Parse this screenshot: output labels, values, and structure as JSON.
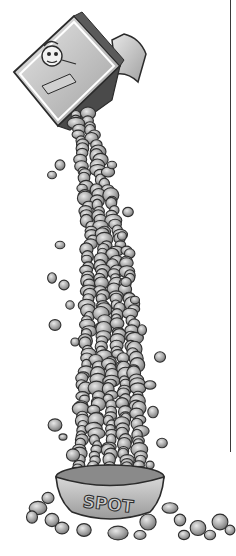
{
  "illustration": {
    "subject": "Dog food bag pouring a tall column of kibble into a dog bowl",
    "bowl_label": "SPOT",
    "bag_label": "",
    "colors": {
      "background": "#ffffff",
      "ink": "#2b2b2b",
      "kibble_light": "#d9d9d9",
      "kibble_mid": "#a8a8a8",
      "kibble_dark": "#6e6e6e",
      "bowl": "#c4c4c4",
      "bag": "#bdbdbd",
      "rule_line": "#3a3a3a"
    }
  }
}
